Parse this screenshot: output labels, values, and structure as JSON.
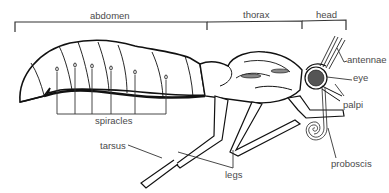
{
  "diagram": {
    "regions": {
      "abdomen": "abdomen",
      "thorax": "thorax",
      "head": "head"
    },
    "labels": {
      "antennae": "antennae",
      "eye": "eye",
      "palpi": "palpi",
      "proboscis": "proboscis",
      "spiracles": "spiracles",
      "tarsus": "tarsus",
      "legs": "legs"
    },
    "colors": {
      "line": "#1a1a1a",
      "label": "#4a4a4a",
      "background": "#ffffff"
    }
  }
}
